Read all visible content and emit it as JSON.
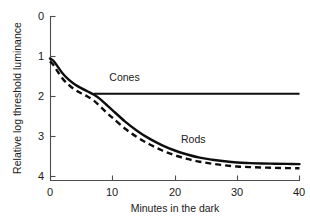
{
  "chart_data": {
    "type": "line",
    "title": "",
    "subtitle": "",
    "xlabel": "Minutes in the dark",
    "ylabel": "Relative log threshold luminance",
    "xlim": [
      0,
      40
    ],
    "ylim": [
      0,
      4
    ],
    "y_axis_inverted": true,
    "grid": false,
    "legend_position": "inline-annotations",
    "xticks": [
      0,
      10,
      20,
      30,
      40
    ],
    "xtick_labels": [
      "0",
      "10",
      "20",
      "30",
      "40"
    ],
    "yticks": [
      0,
      1,
      2,
      3,
      4
    ],
    "ytick_labels": [
      "0",
      "1",
      "2",
      "3",
      "4"
    ],
    "annotations": [
      {
        "text": "Cones",
        "x": 9.5,
        "y": 1.62
      },
      {
        "text": "Rods",
        "x": 21.0,
        "y": 3.17
      }
    ],
    "series": [
      {
        "name": "dark-adaptation-solid",
        "style": "solid",
        "color": "#0d0d0d",
        "x": [
          0,
          0.5,
          1,
          2,
          3,
          4,
          5,
          6,
          7,
          8,
          9,
          10,
          12,
          14,
          16,
          18,
          20,
          22,
          24,
          26,
          28,
          30,
          32,
          34,
          36,
          38,
          40
        ],
        "y": [
          1.05,
          1.1,
          1.2,
          1.42,
          1.58,
          1.7,
          1.79,
          1.87,
          1.95,
          2.06,
          2.2,
          2.34,
          2.62,
          2.86,
          3.06,
          3.22,
          3.35,
          3.45,
          3.53,
          3.58,
          3.62,
          3.65,
          3.665,
          3.675,
          3.68,
          3.685,
          3.69
        ]
      },
      {
        "name": "dark-adaptation-dashed",
        "style": "dashed",
        "color": "#0d0d0d",
        "x": [
          0,
          0.5,
          1,
          2,
          3,
          4,
          5,
          6,
          7,
          8,
          9,
          10,
          12,
          14,
          16,
          18,
          20,
          22,
          24,
          26,
          28,
          30,
          32,
          34,
          36,
          38,
          40
        ],
        "y": [
          1.12,
          1.2,
          1.32,
          1.55,
          1.71,
          1.83,
          1.92,
          2.0,
          2.1,
          2.24,
          2.39,
          2.53,
          2.8,
          3.02,
          3.2,
          3.35,
          3.47,
          3.56,
          3.63,
          3.68,
          3.72,
          3.75,
          3.765,
          3.775,
          3.785,
          3.79,
          3.795
        ]
      },
      {
        "name": "cones-plateau",
        "style": "solid",
        "color": "#0d0d0d",
        "x": [
          7,
          40
        ],
        "y": [
          1.93,
          1.93
        ]
      }
    ]
  }
}
